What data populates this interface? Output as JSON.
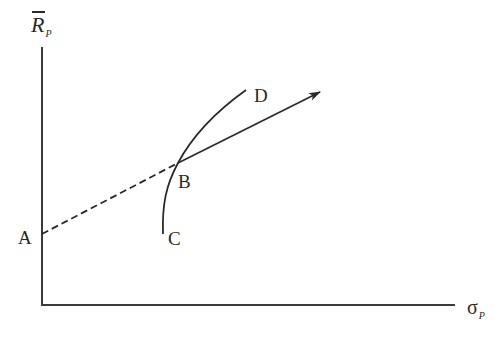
{
  "diagram": {
    "type": "finance-mean-stddev-plot",
    "y_axis": {
      "symbol": "R",
      "overbar": true,
      "subscript": "P"
    },
    "x_axis": {
      "symbol": "σ",
      "subscript": "P"
    },
    "points": {
      "A": "A",
      "B": "B",
      "C": "C",
      "D": "D"
    },
    "elements": [
      {
        "id": "dashed-line-A-B",
        "from": "A",
        "to": "B",
        "style": "dashed"
      },
      {
        "id": "curve-C-D",
        "from": "C",
        "to": "D",
        "style": "solid",
        "passes_through": "B"
      },
      {
        "id": "arrow-from-B",
        "from": "B",
        "style": "solid",
        "arrowhead": true
      }
    ],
    "colors": {
      "line": "#2a2a2a",
      "axis": "#3a3a3a",
      "background": "#ffffff"
    }
  }
}
